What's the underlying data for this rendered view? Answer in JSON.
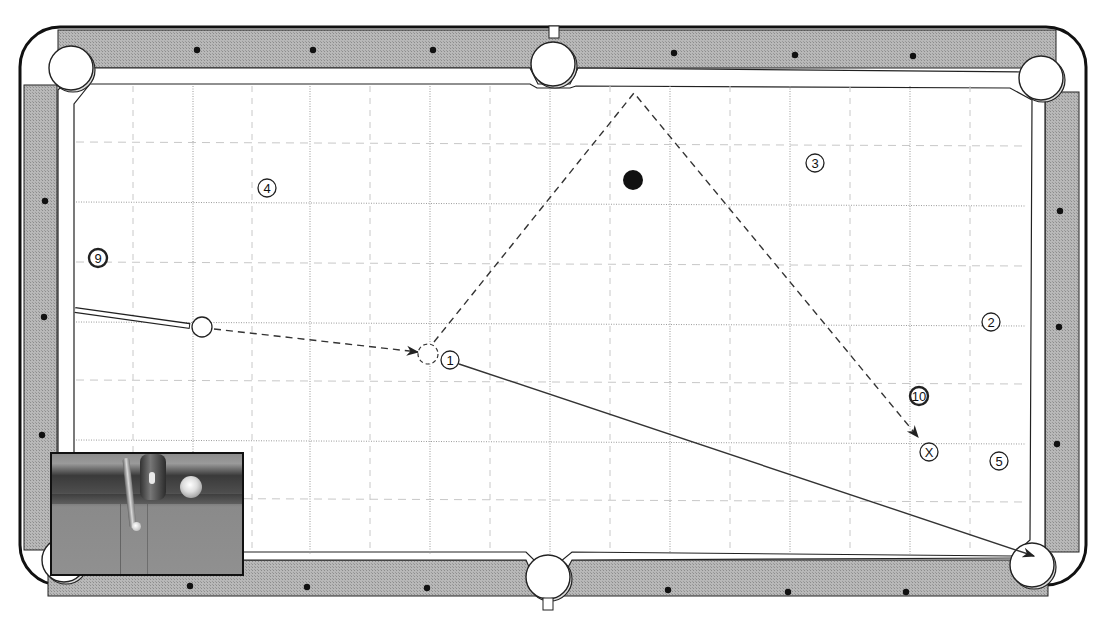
{
  "diagram": {
    "type": "pool-table-shot-diagram",
    "colors": {
      "rail": "#b4b4b4",
      "rail_outline": "#111111",
      "cushion": "#ffffff",
      "felt": "#ffffff",
      "grid_major": "#9a9a9a",
      "grid_minor": "#c8c8c8",
      "path_line": "#333333",
      "diamond": "#111111",
      "black_ball": "#111111"
    },
    "table": {
      "outer": {
        "x": 20,
        "y": 27,
        "w": 1066,
        "h": 558,
        "r": 40
      },
      "playing_surface": {
        "x": 74,
        "y": 84,
        "w": 960,
        "h": 478
      },
      "pockets": [
        {
          "id": "top-left",
          "cx": 71,
          "cy": 68,
          "r": 22
        },
        {
          "id": "top-middle",
          "cx": 553,
          "cy": 64,
          "r": 22
        },
        {
          "id": "top-right",
          "cx": 1041,
          "cy": 78,
          "r": 22
        },
        {
          "id": "bottom-left",
          "cx": 64,
          "cy": 560,
          "r": 22
        },
        {
          "id": "bottom-middle",
          "cx": 548,
          "cy": 577,
          "r": 22
        },
        {
          "id": "bottom-right",
          "cx": 1032,
          "cy": 565,
          "r": 22
        }
      ],
      "diamonds": [
        {
          "x": 197,
          "y": 50
        },
        {
          "x": 313,
          "y": 50
        },
        {
          "x": 433,
          "y": 50
        },
        {
          "x": 674,
          "y": 53
        },
        {
          "x": 795,
          "y": 55
        },
        {
          "x": 913,
          "y": 56
        },
        {
          "x": 45,
          "y": 201
        },
        {
          "x": 44,
          "y": 317
        },
        {
          "x": 42,
          "y": 435
        },
        {
          "x": 1060,
          "y": 211
        },
        {
          "x": 1059,
          "y": 327
        },
        {
          "x": 1057,
          "y": 444
        },
        {
          "x": 190,
          "y": 586
        },
        {
          "x": 307,
          "y": 587
        },
        {
          "x": 427,
          "y": 588
        },
        {
          "x": 668,
          "y": 590
        },
        {
          "x": 788,
          "y": 592
        },
        {
          "x": 906,
          "y": 592
        }
      ]
    },
    "grid": {
      "major_x": [
        193,
        310,
        430,
        550,
        670,
        790,
        910
      ],
      "minor_x": [
        133,
        252,
        370,
        490,
        610,
        730,
        850,
        970
      ],
      "major_y": [
        202,
        322,
        440
      ],
      "minor_y": [
        142,
        262,
        380,
        498
      ]
    },
    "balls": [
      {
        "id": "cue-ball",
        "label": "",
        "cx": 202,
        "cy": 327,
        "r": 10,
        "style": "plain"
      },
      {
        "id": "ghost-ball",
        "label": "",
        "cx": 428,
        "cy": 354,
        "r": 10,
        "style": "dashed"
      },
      {
        "id": "ball-1",
        "label": "1",
        "cx": 450,
        "cy": 360,
        "r": 9,
        "style": "numbered"
      },
      {
        "id": "ball-2",
        "label": "2",
        "cx": 991,
        "cy": 322,
        "r": 9,
        "style": "numbered"
      },
      {
        "id": "ball-3",
        "label": "3",
        "cx": 815,
        "cy": 163,
        "r": 9,
        "style": "numbered"
      },
      {
        "id": "ball-4",
        "label": "4",
        "cx": 267,
        "cy": 188,
        "r": 9,
        "style": "numbered"
      },
      {
        "id": "ball-5",
        "label": "5",
        "cx": 999,
        "cy": 461,
        "r": 9,
        "style": "numbered"
      },
      {
        "id": "ball-9",
        "label": "9",
        "cx": 98,
        "cy": 258,
        "r": 9,
        "style": "striped"
      },
      {
        "id": "ball-10",
        "label": "10",
        "cx": 919,
        "cy": 396,
        "r": 9,
        "style": "striped"
      },
      {
        "id": "target-x",
        "label": "X",
        "cx": 929,
        "cy": 452,
        "r": 9,
        "style": "numbered"
      },
      {
        "id": "black-ball",
        "label": "",
        "cx": 633,
        "cy": 180,
        "r": 10,
        "style": "solid-black"
      }
    ],
    "cue_stick": {
      "from": {
        "x": 75,
        "y": 310
      },
      "to": {
        "x": 190,
        "y": 326
      },
      "width": 6
    },
    "paths": [
      {
        "id": "cue-ball-path",
        "style": "dashed",
        "points": [
          [
            214,
            329
          ],
          [
            418,
            352
          ]
        ],
        "arrow": true
      },
      {
        "id": "cue-ball-deflection",
        "style": "dashed",
        "points": [
          [
            434,
            342
          ],
          [
            634,
            93
          ],
          [
            918,
            437
          ]
        ],
        "arrow": true
      },
      {
        "id": "object-ball-path",
        "style": "solid",
        "points": [
          [
            459,
            364
          ],
          [
            1034,
            556
          ]
        ],
        "arrow": true
      }
    ],
    "inset_photo": {
      "x": 50,
      "y": 452,
      "w": 194,
      "h": 124,
      "description": "Close-up photo of cue stick and ball near rail"
    }
  }
}
